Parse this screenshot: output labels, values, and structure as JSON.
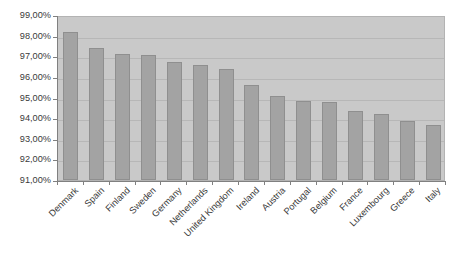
{
  "chart_data": {
    "type": "bar",
    "title": "",
    "subtitle": "",
    "xlabel": "",
    "ylabel": "",
    "ylim": [
      91.0,
      99.0
    ],
    "y_tick_step": 1.0,
    "y_tick_labels": [
      "99,00%",
      "98,00%",
      "97,00%",
      "96,00%",
      "95,00%",
      "94,00%",
      "93,00%",
      "92,00%",
      "91,00%"
    ],
    "y_tick_values": [
      99.0,
      98.0,
      97.0,
      96.0,
      95.0,
      94.0,
      93.0,
      92.0,
      91.0
    ],
    "value_suffix": "%",
    "decimal_separator": ",",
    "grid": true,
    "grid_axis": "y",
    "legend": false,
    "legend_position": "none",
    "categories": [
      "Denmark",
      "Spain",
      "Finland",
      "Sweden",
      "Germany",
      "Netherlands",
      "United Kingdom",
      "Ireland",
      "Austria",
      "Portugal",
      "Belgium",
      "France",
      "Luxembourg",
      "Greece",
      "Italy"
    ],
    "values": [
      98.2,
      97.4,
      97.1,
      97.05,
      96.7,
      96.6,
      96.4,
      95.6,
      95.05,
      94.85,
      94.8,
      94.35,
      94.2,
      93.85,
      93.65
    ],
    "value_labels": [
      "98,20%",
      "97,40%",
      "97,10%",
      "97,05%",
      "96,70%",
      "96,60%",
      "96,40%",
      "95,60%",
      "95,05%",
      "94,85%",
      "94,80%",
      "94,35%",
      "94,20%",
      "93,85%",
      "93,65%"
    ]
  },
  "style": {
    "bar_fill": "#a3a3a3",
    "bar_border": "#8f8f8f",
    "plot_background": "#c9c9c9",
    "gridline_color": "#b7b7b7",
    "axis_color": "#808080",
    "text_color": "#3a3a3a",
    "page_background": "#ffffff"
  }
}
